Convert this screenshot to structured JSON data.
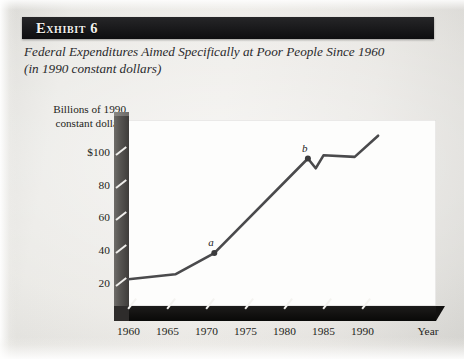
{
  "exhibit": {
    "title": "Exhibit 6",
    "subtitle_line1": "Federal Expenditures Aimed Specifically at Poor People Since 1960",
    "subtitle_line2": "(in 1990 constant dollars)"
  },
  "axes": {
    "y_caption_line1": "Billions of 1990",
    "y_caption_line2": "constant dollars",
    "x_title": "Year",
    "y_ticks": [
      "$100",
      "80",
      "60",
      "40",
      "20"
    ],
    "x_ticks": [
      "1960",
      "1965",
      "1970",
      "1975",
      "1980",
      "1985",
      "1990"
    ]
  },
  "annotations": [
    {
      "label": "a",
      "year": 1971,
      "value": 38
    },
    {
      "label": "b",
      "year": 1983,
      "value": 96
    }
  ],
  "colors": {
    "title_bar": "#161618",
    "title_text": "#f2f1ee",
    "paper": "#e8e7e3",
    "plot_background": "#fdfdfc",
    "series_line": "#4a4a4c",
    "axis_dark": "#111110",
    "axis_gray": "#55534f"
  },
  "chart_data": {
    "type": "line",
    "title": "Federal Expenditures Aimed Specifically at Poor People Since 1960",
    "subtitle": "(in 1990 constant dollars)",
    "xlabel": "Year",
    "ylabel": "Billions of 1990 constant dollars",
    "xlim": [
      1960,
      1993
    ],
    "ylim": [
      12,
      118
    ],
    "yticks": [
      20,
      40,
      60,
      80,
      100
    ],
    "ytick_labels": [
      "20",
      "40",
      "60",
      "80",
      "$100"
    ],
    "xticks": [
      1960,
      1965,
      1970,
      1975,
      1980,
      1985,
      1990
    ],
    "grid": false,
    "legend": "none",
    "series": [
      {
        "name": "Federal expenditures on poor people",
        "x": [
          1960,
          1966,
          1971,
          1983,
          1984,
          1985,
          1989,
          1992
        ],
        "values": [
          22,
          25,
          38,
          96,
          90,
          98,
          97,
          110
        ]
      }
    ],
    "annotations": [
      {
        "label": "a",
        "x": 1971,
        "y": 38
      },
      {
        "label": "b",
        "x": 1983,
        "y": 96
      }
    ]
  }
}
